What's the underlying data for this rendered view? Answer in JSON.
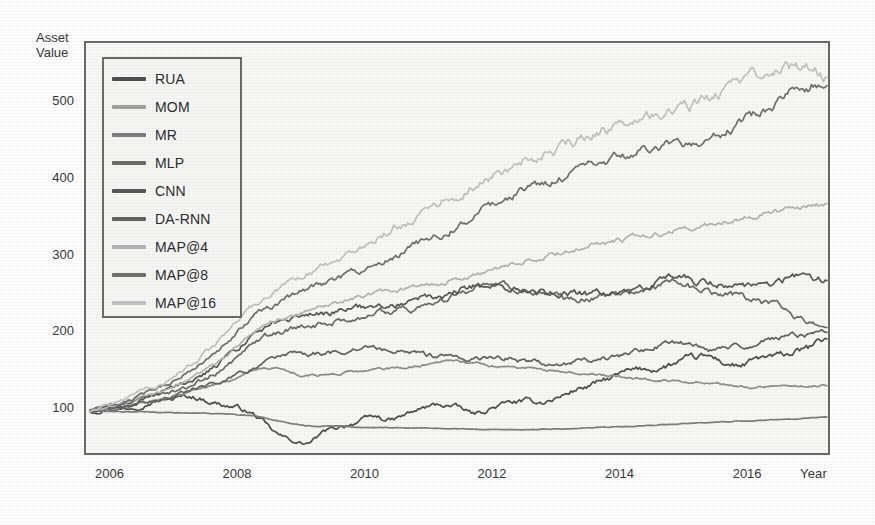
{
  "chart_data": {
    "type": "line",
    "title": "",
    "xlabel": "Year",
    "ylabel": "Asset\nValue",
    "ylabel_line1": "Asset",
    "ylabel_line2": "Value",
    "grid": false,
    "legend_position": "top-left",
    "xlim": [
      2005.6,
      2017.3
    ],
    "ylim": [
      40,
      580
    ],
    "xticks": [
      2006,
      2008,
      2010,
      2012,
      2014,
      2016
    ],
    "xtick_labels": [
      "2006",
      "2008",
      "2010",
      "2012",
      "2014",
      "2016"
    ],
    "yticks": [
      100,
      200,
      300,
      400,
      500
    ],
    "ytick_labels": [
      "100",
      "200",
      "300",
      "400",
      "500"
    ],
    "x": [
      2006.0,
      2006.25,
      2006.5,
      2006.75,
      2007.0,
      2007.25,
      2007.5,
      2007.75,
      2008.0,
      2008.25,
      2008.5,
      2008.75,
      2009.0,
      2009.25,
      2009.5,
      2009.75,
      2010.0,
      2010.25,
      2010.5,
      2010.75,
      2011.0,
      2011.25,
      2011.5,
      2011.75,
      2012.0,
      2012.25,
      2012.5,
      2012.75,
      2013.0,
      2013.25,
      2013.5,
      2013.75,
      2014.0,
      2014.25,
      2014.5,
      2014.75,
      2015.0,
      2015.25,
      2015.5,
      2015.75,
      2016.0,
      2016.25,
      2016.5,
      2016.75,
      2017.0
    ],
    "series": [
      {
        "name": "RUA",
        "color": "#4f4f4f",
        "final_value": 195,
        "values": [
          100,
          104,
          103,
          109,
          114,
          116,
          119,
          114,
          108,
          103,
          92,
          72,
          62,
          58,
          72,
          80,
          86,
          92,
          88,
          96,
          104,
          108,
          104,
          96,
          104,
          110,
          112,
          112,
          118,
          128,
          134,
          142,
          150,
          154,
          156,
          162,
          168,
          170,
          162,
          160,
          168,
          170,
          176,
          182,
          195
        ]
      },
      {
        "name": "MOM",
        "color": "#8e8e8e",
        "final_value": 134,
        "values": [
          100,
          103,
          106,
          110,
          115,
          120,
          126,
          132,
          138,
          146,
          152,
          156,
          150,
          146,
          148,
          150,
          152,
          154,
          156,
          158,
          160,
          162,
          164,
          163,
          160,
          158,
          156,
          154,
          152,
          150,
          148,
          146,
          144,
          142,
          140,
          139,
          137,
          136,
          134,
          132,
          131,
          131,
          132,
          133,
          134
        ]
      },
      {
        "name": "MR",
        "color": "#7d7d7d",
        "final_value": 92,
        "values": [
          100,
          100,
          99,
          99,
          98,
          98,
          97,
          97,
          96,
          95,
          93,
          88,
          84,
          81,
          80,
          80,
          79,
          79,
          78,
          78,
          78,
          77,
          77,
          76,
          76,
          76,
          76,
          76,
          77,
          77,
          78,
          79,
          80,
          81,
          82,
          83,
          84,
          85,
          86,
          87,
          88,
          89,
          90,
          91,
          92
        ]
      },
      {
        "name": "MLP",
        "color": "#6b6b6b",
        "final_value": 213,
        "values": [
          100,
          104,
          108,
          113,
          119,
          126,
          134,
          144,
          156,
          172,
          188,
          200,
          206,
          210,
          214,
          218,
          222,
          226,
          230,
          234,
          238,
          242,
          252,
          262,
          265,
          262,
          258,
          254,
          250,
          248,
          248,
          250,
          252,
          256,
          262,
          268,
          262,
          256,
          252,
          248,
          244,
          236,
          226,
          218,
          213
        ]
      },
      {
        "name": "CNN",
        "color": "#585858",
        "final_value": 272,
        "values": [
          100,
          104,
          109,
          115,
          122,
          130,
          140,
          152,
          166,
          184,
          200,
          212,
          218,
          222,
          226,
          230,
          234,
          238,
          240,
          244,
          246,
          248,
          256,
          262,
          264,
          262,
          258,
          256,
          254,
          252,
          252,
          254,
          256,
          260,
          266,
          276,
          272,
          266,
          264,
          262,
          266,
          270,
          274,
          275,
          272
        ]
      },
      {
        "name": "DA-RNN",
        "color": "#636363",
        "final_value": 202,
        "values": [
          100,
          103,
          106,
          110,
          114,
          119,
          125,
          132,
          140,
          150,
          160,
          168,
          172,
          174,
          176,
          178,
          180,
          182,
          178,
          176,
          172,
          170,
          166,
          168,
          170,
          168,
          166,
          164,
          162,
          164,
          166,
          170,
          174,
          180,
          186,
          190,
          186,
          180,
          182,
          186,
          190,
          194,
          198,
          200,
          202
        ]
      },
      {
        "name": "MAP@4",
        "color": "#b4b4b4",
        "final_value": 370,
        "values": [
          100,
          105,
          110,
          117,
          124,
          133,
          143,
          155,
          170,
          188,
          204,
          216,
          224,
          230,
          236,
          242,
          248,
          254,
          258,
          262,
          266,
          268,
          272,
          276,
          282,
          288,
          294,
          300,
          306,
          312,
          316,
          320,
          324,
          328,
          332,
          336,
          338,
          342,
          348,
          352,
          356,
          360,
          364,
          367,
          370
        ]
      },
      {
        "name": "MAP@8",
        "color": "#707070",
        "final_value": 530,
        "values": [
          100,
          106,
          112,
          120,
          129,
          140,
          152,
          167,
          184,
          206,
          226,
          240,
          250,
          258,
          266,
          274,
          282,
          292,
          300,
          310,
          320,
          330,
          342,
          354,
          366,
          378,
          388,
          396,
          404,
          412,
          420,
          428,
          434,
          440,
          444,
          448,
          452,
          458,
          468,
          478,
          490,
          504,
          518,
          526,
          530
        ]
      },
      {
        "name": "MAP@16",
        "color": "#c2c2c2",
        "final_value": 534,
        "values": [
          100,
          107,
          114,
          123,
          133,
          145,
          159,
          176,
          196,
          220,
          242,
          258,
          270,
          280,
          290,
          300,
          312,
          324,
          336,
          348,
          360,
          372,
          384,
          396,
          408,
          418,
          428,
          436,
          444,
          452,
          460,
          468,
          474,
          480,
          486,
          492,
          498,
          506,
          516,
          526,
          538,
          546,
          550,
          544,
          534
        ]
      }
    ]
  },
  "axis": {
    "y_title_line1": "Asset",
    "y_title_line2": "Value",
    "x_title": "Year"
  },
  "legend": {
    "items": [
      {
        "label": "RUA",
        "color": "#4f4f4f"
      },
      {
        "label": "MOM",
        "color": "#a0a0a0"
      },
      {
        "label": "MR",
        "color": "#7d7d7d"
      },
      {
        "label": "MLP",
        "color": "#6b6b6b"
      },
      {
        "label": "CNN",
        "color": "#585858"
      },
      {
        "label": "DA-RNN",
        "color": "#636363"
      },
      {
        "label": "MAP@4",
        "color": "#b4b4b4"
      },
      {
        "label": "MAP@8",
        "color": "#707070"
      },
      {
        "label": "MAP@16",
        "color": "#c2c2c2"
      }
    ]
  },
  "colors": {
    "frame": "#6a6a6a",
    "plot_background": "#f7f7f5",
    "page_background": "#fdfdfd",
    "text": "#3a3a3a"
  }
}
